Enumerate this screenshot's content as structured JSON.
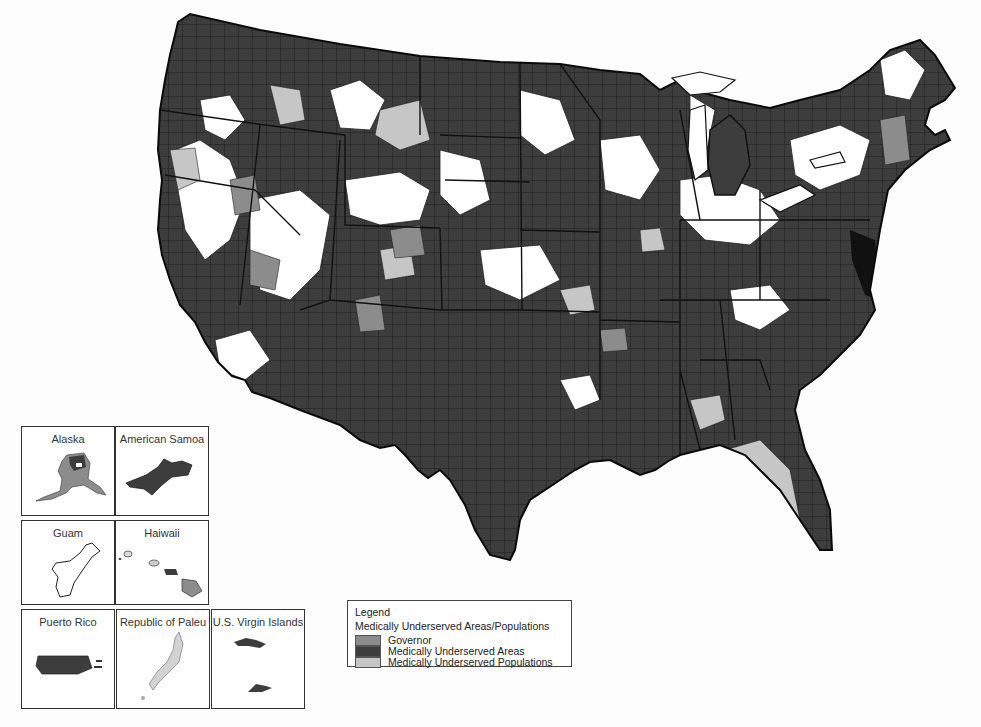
{
  "map": {
    "title": "Medically Underserved Areas/Populations",
    "colors": {
      "governor": "#8c8c8c",
      "mua": "#3d3d3d",
      "mup": "#c6c6c6",
      "none": "#ffffff",
      "border": "#111111"
    }
  },
  "insets": [
    {
      "label": "Alaska"
    },
    {
      "label": "American Samoa"
    },
    {
      "label": "Guam"
    },
    {
      "label": "Haiwaii"
    },
    {
      "label": "Puerto Rico"
    },
    {
      "label": "Republic of Paleu"
    },
    {
      "label": "U.S. Virgin Islands"
    }
  ],
  "legend": {
    "title": "Legend",
    "subtitle": "Medically Underserved Areas/Populations",
    "items": [
      {
        "label": "Governor",
        "color": "#8c8c8c"
      },
      {
        "label": "Medically Underserved Areas",
        "color": "#3d3d3d"
      },
      {
        "label": "Medically Underserved Populations",
        "color": "#c6c6c6"
      }
    ]
  }
}
